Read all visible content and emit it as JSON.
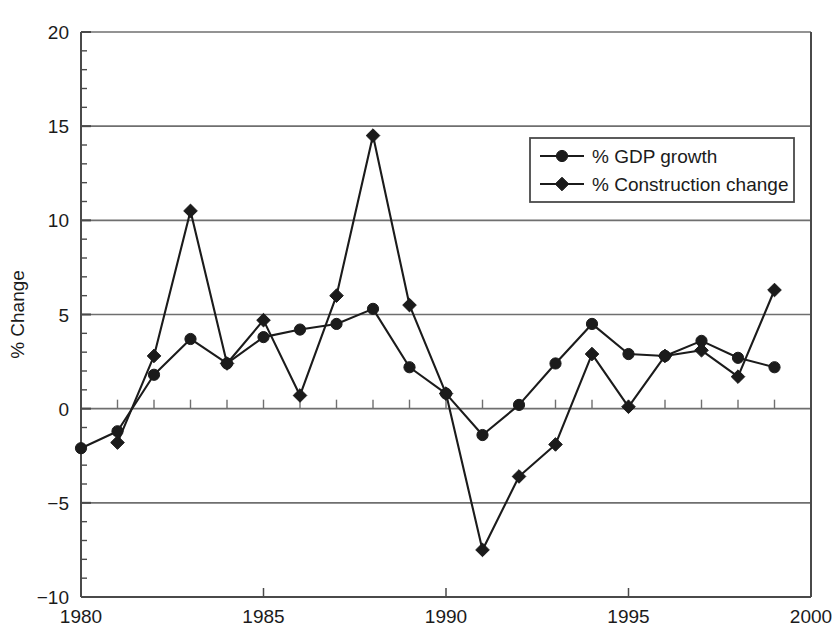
{
  "chart_data": {
    "type": "line",
    "title": "",
    "subtitle": "",
    "xlabel": "",
    "ylabel": "% Change",
    "xlim": [
      1980,
      2000
    ],
    "ylim": [
      -10,
      20
    ],
    "x_ticks": [
      "1980",
      "1985",
      "1990",
      "1995",
      "2000"
    ],
    "x_tick_values": [
      1980,
      1985,
      1990,
      1995,
      2000
    ],
    "y_ticks": [
      "20",
      "15",
      "10",
      "5",
      "0",
      "-5",
      "-10"
    ],
    "y_tick_values": [
      20,
      15,
      10,
      5,
      0,
      -5,
      -10
    ],
    "grid": "horizontal",
    "legend_position": "top-right",
    "x": [
      1980,
      1981,
      1982,
      1983,
      1984,
      1985,
      1986,
      1987,
      1988,
      1989,
      1990,
      1991,
      1992,
      1993,
      1994,
      1995,
      1996,
      1997,
      1998,
      1999
    ],
    "series": [
      {
        "name": "% GDP growth",
        "marker": "circle",
        "values": [
          -2.1,
          -1.2,
          1.8,
          3.7,
          2.4,
          3.8,
          4.2,
          4.5,
          5.3,
          2.2,
          0.8,
          -1.4,
          0.2,
          2.4,
          4.5,
          2.9,
          2.8,
          3.6,
          2.7,
          2.2
        ]
      },
      {
        "name": "% Construction change",
        "marker": "diamond",
        "values": [
          null,
          -1.8,
          2.8,
          10.5,
          2.4,
          4.7,
          0.7,
          6.0,
          14.5,
          5.5,
          0.8,
          -7.5,
          -3.6,
          -1.9,
          2.9,
          0.1,
          2.8,
          3.1,
          1.7,
          6.3
        ]
      }
    ]
  },
  "legend": {
    "items": [
      {
        "label": "% GDP growth",
        "marker": "circle"
      },
      {
        "label": "% Construction change",
        "marker": "diamond"
      }
    ]
  },
  "colors": {
    "line": "#1b1b1b",
    "grid": "#6f6f6f",
    "axis": "#4a4a4a",
    "text": "#1b1b1b",
    "background": "#ffffff"
  }
}
